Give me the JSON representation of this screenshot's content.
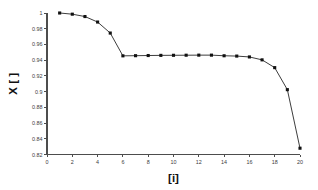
{
  "chart_data": {
    "type": "line",
    "title": "",
    "subtitle": "",
    "xlabel": "[i]",
    "ylabel": "X [ ]",
    "xlim": [
      0,
      20
    ],
    "ylim": [
      0.82,
      1.0
    ],
    "xticks": [
      0,
      2,
      4,
      6,
      8,
      10,
      12,
      14,
      16,
      18,
      20
    ],
    "xtick_labels": [
      "0",
      "2",
      "4",
      "6",
      "8",
      "10",
      "12",
      "14",
      "16",
      "18",
      "20"
    ],
    "yticks": [
      0.82,
      0.84,
      0.86,
      0.88,
      0.9,
      0.92,
      0.94,
      0.96,
      0.98,
      1
    ],
    "ytick_labels": [
      "0.82",
      "0.84",
      "0.86",
      "0.88",
      "0.9",
      "0.92",
      "0.94",
      "0.96",
      "0.98",
      "1"
    ],
    "grid": false,
    "legend": null,
    "marker": "square",
    "line_color": "#1a1a1a",
    "marker_color": "#111111",
    "axis_color": "#4d4d4d",
    "background_color": "#ffffff",
    "x": [
      1,
      2,
      3,
      4,
      5,
      6,
      7,
      8,
      9,
      10,
      11,
      12,
      13,
      14,
      15,
      16,
      17,
      18,
      19,
      20
    ],
    "values": [
      1.0,
      0.9985,
      0.9955,
      0.9885,
      0.9745,
      0.9455,
      0.9457,
      0.9459,
      0.9461,
      0.9462,
      0.9463,
      0.9464,
      0.9464,
      0.9456,
      0.9452,
      0.9441,
      0.9404,
      0.9305,
      0.9025,
      0.828
    ],
    "series": [
      {
        "name": "X",
        "values": [
          1.0,
          0.9985,
          0.9955,
          0.9885,
          0.9745,
          0.9455,
          0.9457,
          0.9459,
          0.9461,
          0.9462,
          0.9463,
          0.9464,
          0.9464,
          0.9456,
          0.9452,
          0.9441,
          0.9404,
          0.9305,
          0.9025,
          0.828
        ]
      }
    ]
  }
}
